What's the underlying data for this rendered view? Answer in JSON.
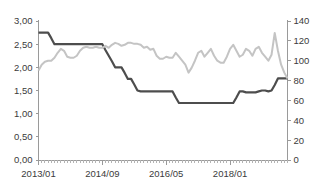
{
  "chart_data": {
    "type": "line",
    "title": "",
    "xlabel": "",
    "ylabel": "",
    "grid": false,
    "legend_position": "none",
    "x_tick_labels": [
      "2013/01",
      "2014/09",
      "2016/05",
      "2018/01"
    ],
    "x_tick_indices": [
      0,
      20,
      40,
      60
    ],
    "x_start": "2013/01",
    "x_end": "2019/08",
    "n_points": 79,
    "left_axis": {
      "label": "",
      "ylim": [
        0.0,
        3.0
      ],
      "tick_labels": [
        "0,00",
        "0,50",
        "1,00",
        "1,50",
        "2,00",
        "2,50",
        "3,00"
      ],
      "tick_values": [
        0.0,
        0.5,
        1.0,
        1.5,
        2.0,
        2.5,
        3.0
      ],
      "decimal_separator": ","
    },
    "right_axis": {
      "label": "",
      "ylim": [
        0,
        140
      ],
      "tick_labels": [
        "0",
        "20",
        "40",
        "60",
        "80",
        "100",
        "120",
        "140"
      ],
      "tick_values": [
        0,
        20,
        40,
        60,
        80,
        100,
        120,
        140
      ]
    },
    "series": [
      {
        "name": "dark-series",
        "axis": "left",
        "color": "#4d4d4d",
        "stroke_width": 2.2,
        "values": [
          2.75,
          2.75,
          2.75,
          2.75,
          2.63,
          2.5,
          2.5,
          2.5,
          2.5,
          2.5,
          2.5,
          2.5,
          2.5,
          2.5,
          2.5,
          2.5,
          2.5,
          2.5,
          2.5,
          2.5,
          2.5,
          2.37,
          2.25,
          2.13,
          2.0,
          2.0,
          2.0,
          1.88,
          1.75,
          1.75,
          1.63,
          1.5,
          1.48,
          1.48,
          1.48,
          1.48,
          1.48,
          1.48,
          1.48,
          1.48,
          1.48,
          1.48,
          1.48,
          1.35,
          1.23,
          1.23,
          1.23,
          1.23,
          1.23,
          1.23,
          1.23,
          1.23,
          1.23,
          1.23,
          1.23,
          1.23,
          1.23,
          1.23,
          1.23,
          1.23,
          1.23,
          1.23,
          1.35,
          1.48,
          1.48,
          1.46,
          1.46,
          1.46,
          1.46,
          1.48,
          1.5,
          1.5,
          1.48,
          1.5,
          1.62,
          1.76,
          1.76,
          1.76,
          1.76
        ]
      },
      {
        "name": "light-series",
        "axis": "right",
        "color": "#c4c4c4",
        "stroke_width": 2.0,
        "values": [
          90,
          96,
          99,
          100,
          100,
          103,
          108,
          112,
          110,
          104,
          103,
          103,
          105,
          110,
          113,
          114,
          113,
          113,
          114,
          113,
          113,
          115,
          113,
          116,
          118,
          117,
          115,
          116,
          118,
          118,
          117,
          117,
          116,
          113,
          114,
          111,
          112,
          105,
          102,
          102,
          104,
          103,
          103,
          108,
          104,
          100,
          96,
          88,
          93,
          100,
          108,
          110,
          104,
          108,
          112,
          105,
          100,
          98,
          98,
          104,
          112,
          116,
          110,
          104,
          106,
          112,
          110,
          105,
          112,
          114,
          108,
          104,
          100,
          106,
          128,
          110,
          96,
          88,
          82
        ]
      }
    ]
  }
}
